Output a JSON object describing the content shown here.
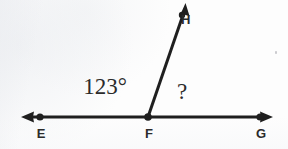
{
  "figure": {
    "stroke_color": "#1f1f1f",
    "background_color": "#fdfdfd",
    "points": [
      {
        "name": "E",
        "label": "E",
        "x": 40,
        "y": 117,
        "dot": true
      },
      {
        "name": "F",
        "label": "F",
        "x": 148,
        "y": 117,
        "dot": true
      },
      {
        "name": "G",
        "label": "G",
        "x": 260,
        "y": 117,
        "dot": true
      },
      {
        "name": "H",
        "label": "H",
        "x": 185,
        "y": 4,
        "dot": false
      }
    ],
    "lines": [
      {
        "name": "line-EG",
        "from": "E",
        "to": "G",
        "arrow_start": true,
        "arrow_end": true
      },
      {
        "name": "ray-FH",
        "from": "F",
        "to": "H",
        "arrow_start": false,
        "arrow_end": true
      }
    ],
    "angles": [
      {
        "name": "angle-EFH",
        "label": "123°",
        "vertex": "F",
        "value": 123,
        "unit": "degrees"
      },
      {
        "name": "angle-HFG",
        "label": "?",
        "vertex": "F",
        "value": null,
        "unit": "degrees"
      }
    ]
  }
}
